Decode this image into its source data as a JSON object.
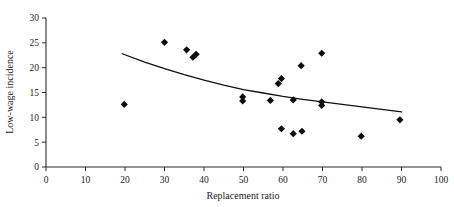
{
  "chart_data": {
    "type": "scatter",
    "title": "",
    "xlabel": "Replacement ratio",
    "ylabel": "Low-wage incidence",
    "xlim": [
      0,
      100
    ],
    "ylim": [
      0,
      30
    ],
    "xticks": [
      0,
      10,
      20,
      30,
      40,
      50,
      60,
      70,
      80,
      90,
      100
    ],
    "yticks": [
      0,
      5,
      10,
      15,
      20,
      25,
      30
    ],
    "grid": false,
    "legend": null,
    "marker": "diamond",
    "marker_color": "#0d0d0d",
    "points": [
      {
        "x": 19.8,
        "y": 12.6
      },
      {
        "x": 30.0,
        "y": 25.1
      },
      {
        "x": 35.6,
        "y": 23.6
      },
      {
        "x": 37.2,
        "y": 22.1
      },
      {
        "x": 38.0,
        "y": 22.7
      },
      {
        "x": 49.8,
        "y": 14.1
      },
      {
        "x": 49.8,
        "y": 13.3
      },
      {
        "x": 56.8,
        "y": 13.4
      },
      {
        "x": 58.8,
        "y": 16.8
      },
      {
        "x": 59.6,
        "y": 17.8
      },
      {
        "x": 59.6,
        "y": 7.7
      },
      {
        "x": 62.6,
        "y": 13.5
      },
      {
        "x": 62.6,
        "y": 6.7
      },
      {
        "x": 64.6,
        "y": 20.4
      },
      {
        "x": 64.8,
        "y": 7.2
      },
      {
        "x": 69.8,
        "y": 13.1
      },
      {
        "x": 69.8,
        "y": 12.4
      },
      {
        "x": 69.8,
        "y": 22.9
      },
      {
        "x": 79.8,
        "y": 6.2
      },
      {
        "x": 89.6,
        "y": 9.5
      }
    ],
    "trend": {
      "type": "fitted-curve",
      "x_start": 19.3,
      "x_end": 90.0,
      "y_start": 22.8,
      "y_end": 11.1,
      "path_points": [
        {
          "x": 19.3,
          "y": 22.8
        },
        {
          "x": 25.0,
          "y": 21.1
        },
        {
          "x": 30.0,
          "y": 19.8
        },
        {
          "x": 35.0,
          "y": 18.6
        },
        {
          "x": 40.0,
          "y": 17.5
        },
        {
          "x": 45.0,
          "y": 16.5
        },
        {
          "x": 50.0,
          "y": 15.6
        },
        {
          "x": 55.0,
          "y": 14.9
        },
        {
          "x": 60.0,
          "y": 14.2
        },
        {
          "x": 65.0,
          "y": 13.6
        },
        {
          "x": 70.0,
          "y": 13.1
        },
        {
          "x": 75.0,
          "y": 12.6
        },
        {
          "x": 80.0,
          "y": 12.1
        },
        {
          "x": 85.0,
          "y": 11.6
        },
        {
          "x": 90.0,
          "y": 11.1
        }
      ]
    }
  },
  "axes": {
    "x_tick_labels": [
      "0",
      "10",
      "20",
      "30",
      "40",
      "50",
      "60",
      "70",
      "80",
      "90",
      "100"
    ],
    "y_tick_labels": [
      "0",
      "5",
      "10",
      "15",
      "20",
      "25",
      "30"
    ],
    "x_axis_title": "Replacement ratio",
    "y_axis_title": "Low-wage incidence"
  }
}
